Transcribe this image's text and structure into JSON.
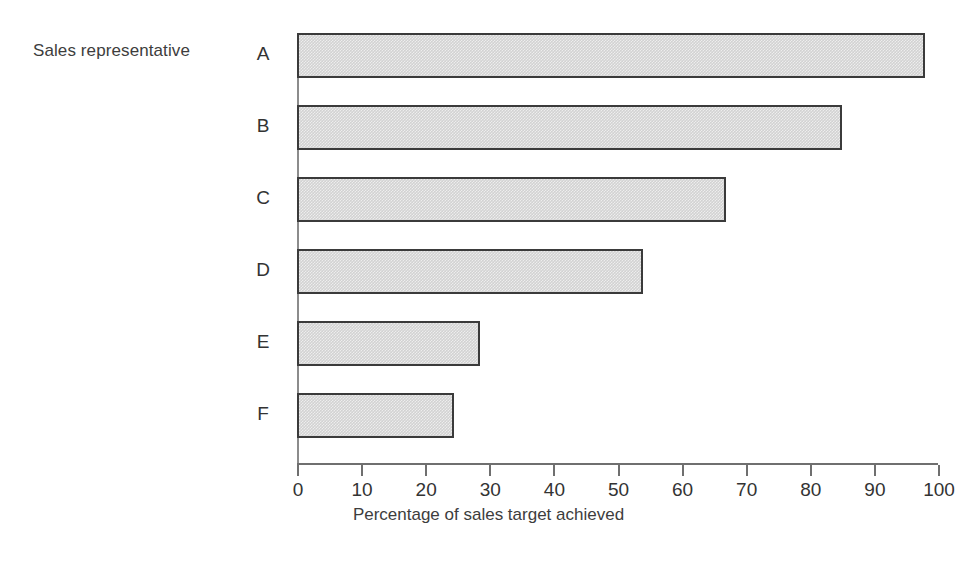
{
  "chart_data": {
    "type": "bar",
    "orientation": "horizontal",
    "title": "",
    "categories": [
      "A",
      "B",
      "C",
      "D",
      "E",
      "F"
    ],
    "values": [
      98,
      85,
      67,
      54,
      28.5,
      24.5
    ],
    "xlabel": "Percentage of sales target achieved",
    "ylabel": "Sales representative",
    "xlim": [
      0,
      100
    ],
    "xticks": [
      0,
      10,
      20,
      30,
      40,
      50,
      60,
      70,
      80,
      90,
      100
    ],
    "xtick_labels": [
      "0",
      "10",
      "20",
      "30",
      "40",
      "50",
      "60",
      "70",
      "80",
      "90",
      "100"
    ],
    "grid": false,
    "legend": false,
    "bar_fill_color": "#d2d2d2",
    "bar_border_color": "#3b3b3b",
    "axis_color": "#6f6f6f",
    "text_color": "#333333"
  }
}
